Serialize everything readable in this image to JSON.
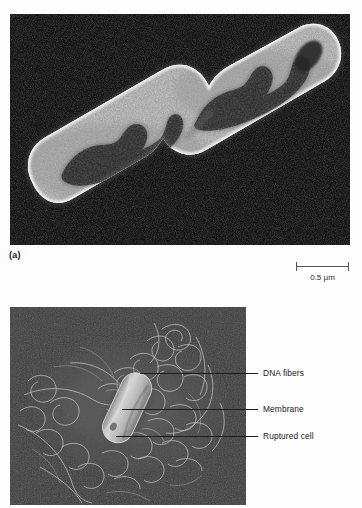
{
  "figure": {
    "panel_a": {
      "label": "(a)",
      "caption_alt": "Transmission electron micrograph of a dividing bacterial cell",
      "background_color": "#000000",
      "scale_bar": {
        "label": "0.5 µm",
        "value": 0.5,
        "unit": "µm"
      }
    },
    "panel_b": {
      "caption_alt": "Scanning electron micrograph of a ruptured bacterial cell with DNA released",
      "background_color": "#3b3b3b",
      "callouts": [
        {
          "label": "DNA fibers"
        },
        {
          "label": "Membrane"
        },
        {
          "label": "Ruptured cell"
        }
      ]
    }
  },
  "colors": {
    "page_background": "#fdfdfd",
    "text": "#1b1b1b",
    "rule": "#1c1c1c",
    "scalebar": "#555555"
  }
}
